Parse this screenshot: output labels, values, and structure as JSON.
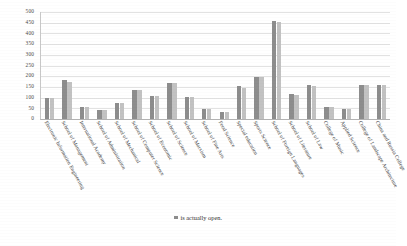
{
  "chart_data": {
    "type": "bar",
    "title": "",
    "xlabel": "",
    "ylabel": "",
    "ylim": [
      0,
      500
    ],
    "ytick_step": 50,
    "grid": true,
    "legend_position": "bottom",
    "legend": [
      "is actually open."
    ],
    "categories": [
      "Electronic Information Engineering",
      "School of Management",
      "International Academy",
      "School of Administration",
      "School of Mechanical",
      "School of Computer Science",
      "School of Economic",
      "School of Science",
      "School of Marxism",
      "School of Fine Arts",
      "Food Science",
      "Special education",
      "Sports Science",
      "School of Foreign Languages",
      "School of Literature",
      "School of Law",
      "College of Music",
      "Applied Science",
      "College of Landscape Architecture",
      "China and Russia College"
    ],
    "series": [
      {
        "name": "is actually open.",
        "color": "#8d8d8d",
        "values": [
          100,
          180,
          58,
          42,
          75,
          135,
          108,
          170,
          102,
          48,
          35,
          155,
          195,
          460,
          115,
          157,
          55,
          48,
          160,
          160
        ]
      },
      {
        "name": "",
        "color": "#c2c2c2",
        "values": [
          98,
          175,
          57,
          42,
          76,
          136,
          107,
          168,
          103,
          47,
          34,
          147,
          194,
          455,
          113,
          155,
          54,
          47,
          158,
          158
        ]
      }
    ],
    "yticks": [
      "0",
      "50",
      "100",
      "150",
      "200",
      "250",
      "300",
      "350",
      "400",
      "450",
      "500"
    ]
  },
  "colors": {
    "series_a": "#8d8d8d",
    "series_b": "#c2c2c2",
    "grid": "#e2e2e2",
    "axis": "#b4b4b4",
    "text": "#3c3c3c",
    "background": "#ffffff"
  }
}
